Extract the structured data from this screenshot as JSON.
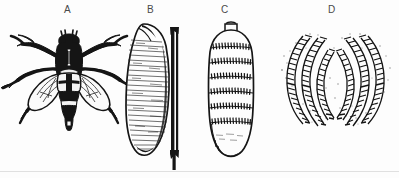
{
  "figure": {
    "background_color": "#fdfdfd",
    "ink_color": "#1a1a1a",
    "style": "engraved line drawing / halftone scan",
    "panel_count": 4
  },
  "panels": [
    {
      "label": "A",
      "label_x": 68,
      "label_y": 6,
      "subject": "adult-fly-dorsal",
      "description": "dorsal view of adult bot fly with spread legs, banded abdomen and hyaline wings"
    },
    {
      "label": "B",
      "label_x": 150,
      "label_y": 6,
      "subject": "larva-lateral",
      "description": "lateral view of mature larva with fine transverse striations and dark vertical rule alongside"
    },
    {
      "label": "C",
      "label_x": 224,
      "label_y": 6,
      "subject": "larva-ventral",
      "description": "ventral view of segmented larva showing transverse bands of spines"
    },
    {
      "label": "D",
      "label_x": 331,
      "label_y": 6,
      "subject": "posterior-spiracular-plates",
      "description": "paired mirror-image posterior spiracular plates with ladder-like sinuous slits"
    }
  ],
  "baseline": {
    "visible": true,
    "y": 171
  }
}
